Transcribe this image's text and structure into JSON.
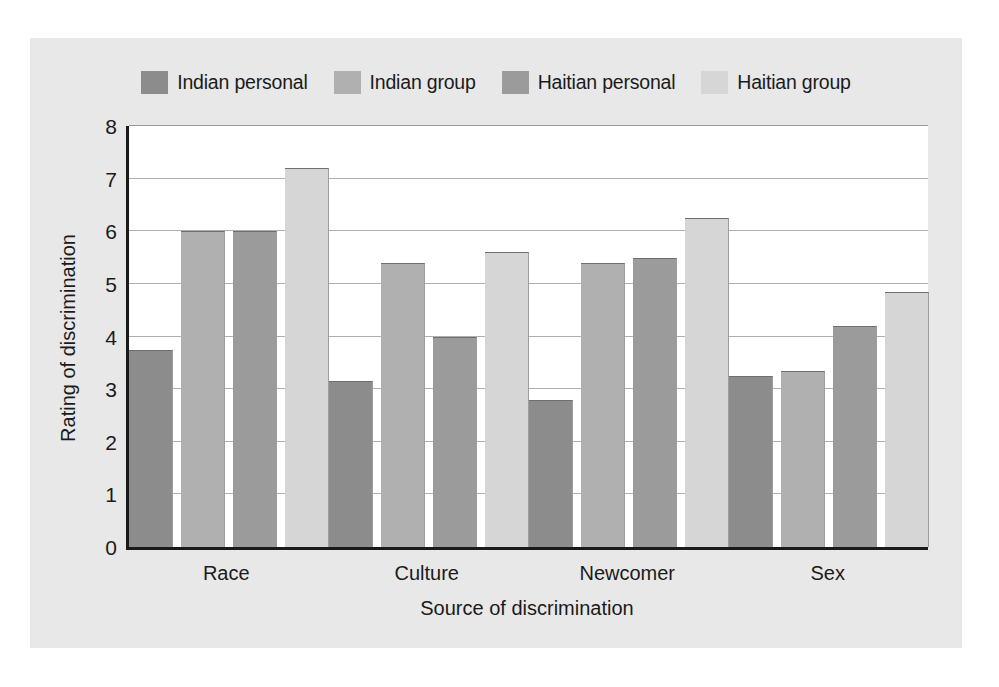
{
  "chart_data": {
    "type": "bar",
    "title": "",
    "subtitle": "",
    "xlabel": "Source of discrimination",
    "ylabel": "Rating of discrimination",
    "categories": [
      "Race",
      "Culture",
      "Newcomer",
      "Sex"
    ],
    "ylim": [
      0,
      8
    ],
    "yticks": [
      8,
      7,
      6,
      5,
      4,
      3,
      2,
      1,
      0
    ],
    "grid": true,
    "legend_position": "top-center",
    "series": [
      {
        "name": "Indian personal",
        "color": "#8c8c8c",
        "values": [
          3.75,
          3.15,
          2.8,
          3.25
        ]
      },
      {
        "name": "Indian group",
        "color": "#b0b0b0",
        "values": [
          6.0,
          5.4,
          5.4,
          3.35
        ]
      },
      {
        "name": "Haitian personal",
        "color": "#9b9b9b",
        "values": [
          6.0,
          4.0,
          5.5,
          4.2
        ]
      },
      {
        "name": "Haitian group",
        "color": "#d6d6d6",
        "values": [
          7.2,
          5.6,
          6.25,
          4.85
        ]
      }
    ]
  },
  "figure": {
    "background_color": "#e8e8e8",
    "plot_background_color": "#ffffff",
    "axis_color": "#1a1a1a",
    "gridline_color": "#b0b0b0"
  }
}
